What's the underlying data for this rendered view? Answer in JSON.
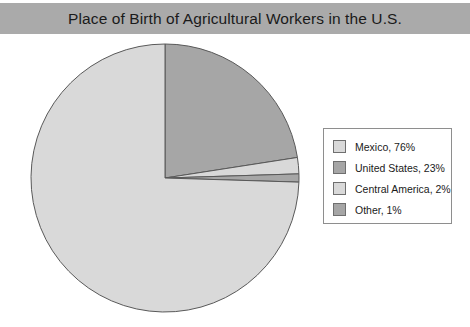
{
  "title": "Place of Birth of Agricultural Workers in the U.S.",
  "colors": {
    "title_band": "#aaaaaa",
    "title_text": "#1a1a1a",
    "background": "#ffffff",
    "slice_light": "#d9d9d9",
    "slice_dark": "#a6a6a6",
    "slice_outline": "#595959",
    "legend_border": "#8e8e8e",
    "legend_background": "#ffffff"
  },
  "legend": {
    "entries": [
      {
        "label": "Mexico, 76%",
        "color": "#d9d9d9"
      },
      {
        "label": "United States, 23%",
        "color": "#a6a6a6"
      },
      {
        "label": "Central America, 2%",
        "color": "#d9d9d9"
      },
      {
        "label": "Other, 1%",
        "color": "#a6a6a6"
      }
    ]
  },
  "chart_data": {
    "type": "pie",
    "title": "Place of Birth of Agricultural Workers in the U.S.",
    "xlabel": "",
    "ylabel": "",
    "legend_position": "right",
    "grid": false,
    "start_angle_deg": 90,
    "direction": "clockwise",
    "center": {
      "x": 165,
      "y": 178
    },
    "radius": 134,
    "categories": [
      "Mexico",
      "United States",
      "Central America",
      "Other"
    ],
    "values": [
      76,
      23,
      2,
      1
    ],
    "value_unit": "percent",
    "labels": [
      "Mexico, 76%",
      "United States, 23%",
      "Central America, 2%",
      "Other, 1%"
    ],
    "slice_colors": [
      "#d9d9d9",
      "#a6a6a6",
      "#d9d9d9",
      "#a6a6a6"
    ],
    "draw_order": [
      "United States",
      "Central America",
      "Other",
      "Mexico"
    ]
  }
}
